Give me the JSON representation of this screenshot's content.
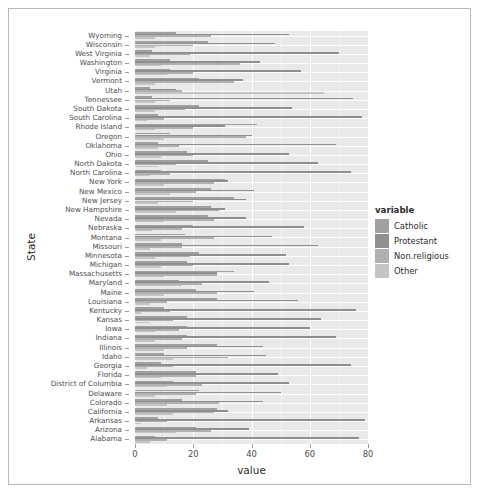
{
  "chart_data": {
    "type": "bar",
    "orientation": "horizontal",
    "title": "",
    "xlabel": "value",
    "ylabel": "State",
    "xlim": [
      0,
      80
    ],
    "xticks": [
      0,
      20,
      40,
      60,
      80
    ],
    "grid": true,
    "legend": {
      "title": "variable",
      "position": "right",
      "entries": [
        {
          "name": "Catholic",
          "color": "#a0a0a0"
        },
        {
          "name": "Protestant",
          "color": "#8f8f8f"
        },
        {
          "name": "Non.religious",
          "color": "#b0b0b0"
        },
        {
          "name": "Other",
          "color": "#c4c4c4"
        }
      ]
    },
    "series_order": [
      "Catholic",
      "Protestant",
      "Non.religious",
      "Other"
    ],
    "categories": [
      "Wyoming",
      "Wisconsin",
      "West Virginia",
      "Washington",
      "Virginia",
      "Vermont",
      "Utah",
      "Tennessee",
      "South Dakota",
      "South Carolina",
      "Rhode Island",
      "Oregon",
      "Oklahoma",
      "Ohio",
      "North Dakota",
      "North Carolina",
      "New York",
      "New Mexico",
      "New Jersey",
      "New Hampshire",
      "Nevada",
      "Nebraska",
      "Montana",
      "Missouri",
      "Minnesota",
      "Michigan",
      "Massachusetts",
      "Maryland",
      "Maine",
      "Louisiana",
      "Kentucky",
      "Kansas",
      "Iowa",
      "Indiana",
      "Illinois",
      "Idaho",
      "Georgia",
      "Florida",
      "District of Columbia",
      "Delaware",
      "Colorado",
      "California",
      "Arkansas",
      "Arizona",
      "Alabama"
    ],
    "series": [
      {
        "name": "Catholic",
        "values": [
          14,
          25,
          6,
          12,
          12,
          22,
          5,
          6,
          22,
          8,
          42,
          12,
          8,
          18,
          25,
          9,
          31,
          26,
          34,
          26,
          25,
          20,
          17,
          16,
          22,
          18,
          34,
          15,
          21,
          28,
          10,
          18,
          18,
          18,
          28,
          10,
          9,
          21,
          13,
          22,
          16,
          28,
          8,
          21,
          7
        ]
      },
      {
        "name": "Protestant",
        "values": [
          53,
          48,
          70,
          43,
          57,
          37,
          14,
          75,
          54,
          78,
          31,
          40,
          69,
          53,
          63,
          74,
          32,
          41,
          38,
          31,
          38,
          58,
          47,
          63,
          52,
          53,
          28,
          46,
          41,
          56,
          76,
          64,
          60,
          69,
          44,
          45,
          74,
          49,
          53,
          50,
          44,
          32,
          79,
          39,
          77
        ]
      },
      {
        "name": "Non.religious",
        "values": [
          26,
          20,
          19,
          36,
          20,
          34,
          16,
          12,
          17,
          10,
          20,
          38,
          15,
          20,
          14,
          12,
          27,
          21,
          20,
          29,
          27,
          16,
          27,
          16,
          19,
          20,
          28,
          23,
          28,
          11,
          12,
          13,
          15,
          16,
          18,
          32,
          13,
          21,
          23,
          21,
          29,
          27,
          11,
          26,
          11
        ]
      },
      {
        "name": "Other",
        "values": [
          7,
          7,
          5,
          9,
          11,
          7,
          65,
          7,
          7,
          4,
          7,
          10,
          8,
          9,
          8,
          5,
          10,
          12,
          8,
          14,
          10,
          6,
          9,
          5,
          7,
          9,
          10,
          16,
          10,
          5,
          2,
          5,
          7,
          7,
          10,
          13,
          4,
          9,
          11,
          7,
          11,
          13,
          2,
          14,
          5
        ]
      }
    ]
  }
}
